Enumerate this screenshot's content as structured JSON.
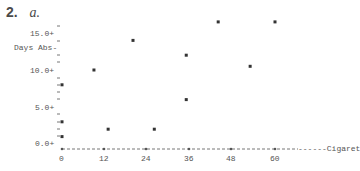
{
  "heading": {
    "number": "2.",
    "letter": "a."
  },
  "chart_data": {
    "type": "scatter",
    "title": "",
    "xlabel": "Cigaret",
    "ylabel": "Days Abs",
    "x_ticks": [
      "0",
      "12",
      "24",
      "36",
      "48",
      "60"
    ],
    "y_ticks": [
      "0.0+",
      "5.0+",
      "10.0+",
      "15.0+"
    ],
    "xlim": [
      0,
      66
    ],
    "ylim": [
      0,
      17
    ],
    "grid": false,
    "marker": "*",
    "points": [
      {
        "x": 0,
        "y": 8
      },
      {
        "x": 0,
        "y": 3
      },
      {
        "x": 0,
        "y": 1
      },
      {
        "x": 9,
        "y": 10
      },
      {
        "x": 13,
        "y": 2
      },
      {
        "x": 20,
        "y": 14
      },
      {
        "x": 26,
        "y": 2
      },
      {
        "x": 35,
        "y": 12
      },
      {
        "x": 35,
        "y": 6
      },
      {
        "x": 44,
        "y": 16.5
      },
      {
        "x": 53,
        "y": 10.5
      },
      {
        "x": 60,
        "y": 16.5
      }
    ]
  }
}
